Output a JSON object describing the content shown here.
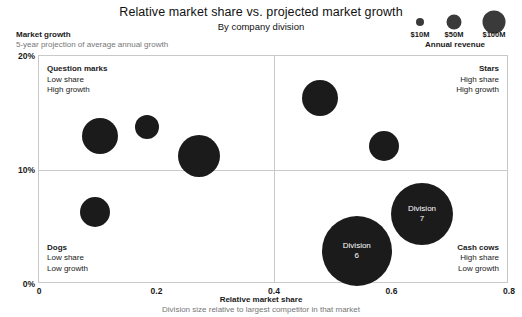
{
  "header": {
    "title": "Relative market share vs. projected market growth",
    "subtitle": "By company division"
  },
  "yaxis": {
    "title": "Market growth",
    "subtitle": "5-year projection of average annual growth",
    "ticks": [
      "20%",
      "10%",
      "0%"
    ]
  },
  "xaxis": {
    "title": "Relative market share",
    "subtitle": "Division size relative to largest competitor in that market",
    "ticks": [
      "0",
      "0.2",
      "0.4",
      "0.6",
      "0.8"
    ]
  },
  "legend": {
    "title": "Annual revenue",
    "items": [
      {
        "label": "$10M",
        "diameter": 8
      },
      {
        "label": "$50M",
        "diameter": 15
      },
      {
        "label": "$100M",
        "diameter": 23
      }
    ]
  },
  "quadrants": [
    {
      "key": "question-marks",
      "name": "Question marks",
      "line1": "Low share",
      "line2": "High growth"
    },
    {
      "key": "stars",
      "name": "Stars",
      "line1": "High share",
      "line2": "High growth"
    },
    {
      "key": "dogs",
      "name": "Dogs",
      "line1": "Low share",
      "line2": "Low growth"
    },
    {
      "key": "cash-cows",
      "name": "Cash cows",
      "line1": "High share",
      "line2": "Low growth"
    }
  ],
  "chart_data": {
    "type": "scatter",
    "title": "Relative market share vs. projected market growth",
    "subtitle": "By company division",
    "xlabel": "Relative market share",
    "ylabel": "Market growth",
    "xlim": [
      0,
      0.8
    ],
    "ylim": [
      0,
      20
    ],
    "xticks": [
      0,
      0.2,
      0.4,
      0.6,
      0.8
    ],
    "yticks": [
      0,
      10,
      20
    ],
    "grid": false,
    "legend_position": "top-right",
    "size_legend": {
      "title": "Annual revenue",
      "values": [
        "$10M",
        "$50M",
        "$100M"
      ]
    },
    "quadrant_dividers": {
      "x": 0.4,
      "y": 10
    },
    "points": [
      {
        "label": "",
        "x": 0.104,
        "y": 13.0,
        "r": 18
      },
      {
        "label": "",
        "x": 0.184,
        "y": 13.8,
        "r": 12
      },
      {
        "label": "",
        "x": 0.272,
        "y": 11.2,
        "r": 21
      },
      {
        "label": "",
        "x": 0.095,
        "y": 6.3,
        "r": 15
      },
      {
        "label": "",
        "x": 0.478,
        "y": 16.3,
        "r": 18
      },
      {
        "label": "",
        "x": 0.587,
        "y": 12.1,
        "r": 15
      },
      {
        "label": "Division\n6",
        "x": 0.541,
        "y": 2.9,
        "r": 35
      },
      {
        "label": "Division\n7",
        "x": 0.652,
        "y": 6.1,
        "r": 31
      }
    ]
  }
}
